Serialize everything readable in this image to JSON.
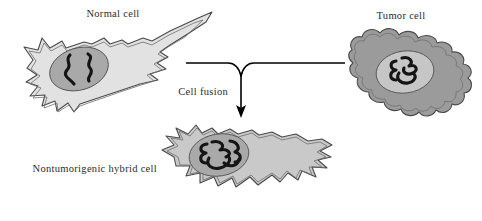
{
  "figure": {
    "width": 482,
    "height": 221,
    "background": "#ffffff"
  },
  "labels": {
    "normal_cell": "Normal cell",
    "tumor_cell": "Tumor cell",
    "cell_fusion": "Cell fusion",
    "hybrid_cell": "Nontumorigenic hybrid cell"
  },
  "colors": {
    "normal_cytoplasm": "#e2e2e2",
    "normal_nucleus": "#a9a9a9",
    "tumor_cytoplasm": "#9b9b9b",
    "tumor_nucleus": "#c6c6c6",
    "hybrid_cytoplasm": "#c9c9c9",
    "hybrid_nucleus": "#a9a9a9",
    "outline": "#4a4a4a",
    "chromosome": "#141414",
    "arrow": "#000000",
    "text": "#2b2b2b"
  },
  "cells": [
    {
      "name": "normal-cell",
      "label": "Normal cell",
      "shape": "elongated spiky fibroblast",
      "cytoplasm": "#e2e2e2",
      "nucleus": "#a9a9a9",
      "chromosome_count": 2,
      "chromosome_style": "two separate squiggles"
    },
    {
      "name": "tumor-cell",
      "label": "Tumor cell",
      "shape": "lobed amoeboid blob",
      "cytoplasm": "#9b9b9b",
      "nucleus": "#c6c6c6",
      "chromosome_count": 3,
      "chromosome_style": "tangled squiggles"
    },
    {
      "name": "hybrid-cell",
      "label": "Nontumorigenic hybrid cell",
      "shape": "elongated spiky fibroblast",
      "cytoplasm": "#c9c9c9",
      "nucleus": "#a9a9a9",
      "chromosome_count": 5,
      "chromosome_style": "dense interlocked tangle"
    }
  ],
  "connector": {
    "description": "two horizontal lines from the normal cell and tumor cell converge to a single downward arrow to the hybrid cell",
    "annotation": "Cell fusion"
  }
}
